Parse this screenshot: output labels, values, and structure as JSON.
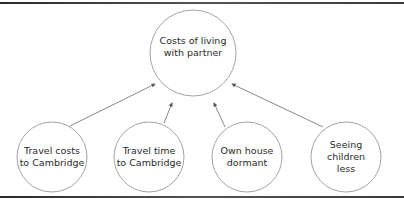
{
  "diagram": {
    "type": "influence-diagram",
    "colors": {
      "stroke": "#9a9a9a",
      "arrow": "#555555",
      "text": "#2b2b2b",
      "rule": "#3a3a3a"
    },
    "target": {
      "label": "Costs of living\nwith partner",
      "cx": 193,
      "cy": 53,
      "r": 43
    },
    "factors": [
      {
        "label": "Travel costs\nto Cambridge",
        "cx": 52,
        "cy": 157,
        "r": 35
      },
      {
        "label": "Travel time\nto Cambridge",
        "cx": 149,
        "cy": 157,
        "r": 35
      },
      {
        "label": "Own house\ndormant",
        "cx": 247,
        "cy": 157,
        "r": 35
      },
      {
        "label": "Seeing\nchildren\nless",
        "cx": 346,
        "cy": 157,
        "r": 35
      }
    ],
    "arrows": [
      {
        "from": "Travel costs to Cambridge",
        "x1": 70,
        "y1": 126,
        "x2": 155,
        "y2": 84
      },
      {
        "from": "Travel time to Cambridge",
        "x1": 164,
        "y1": 123,
        "x2": 172,
        "y2": 103
      },
      {
        "from": "Own house dormant",
        "x1": 225,
        "y1": 127,
        "x2": 214,
        "y2": 103
      },
      {
        "from": "Seeing children less",
        "x1": 323,
        "y1": 127,
        "x2": 232,
        "y2": 84
      }
    ]
  }
}
